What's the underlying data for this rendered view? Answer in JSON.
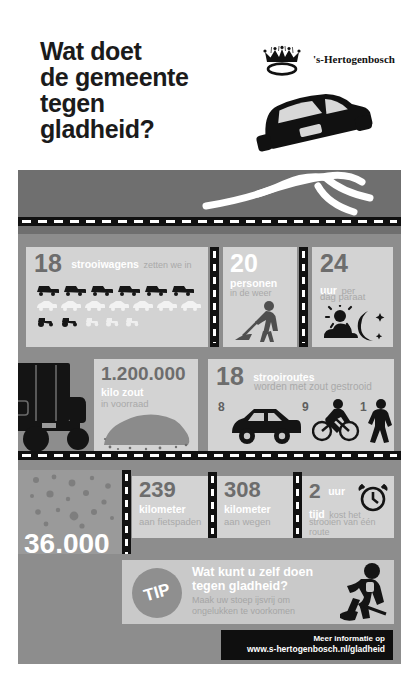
{
  "poster": {
    "title_lines": [
      "Wat doet",
      "de gemeente",
      "tegen",
      "gladheid?"
    ],
    "city": "'s-Hertogenbosch"
  },
  "colors": {
    "page_bg": "#ffffff",
    "poster_bg": "#8d8d8d",
    "panel": "#c9c9c9",
    "road": "#6f6f6f",
    "dash": "#111111",
    "num_grey": "#6d6d6d",
    "label_white": "#ffffff",
    "sub_grey": "#a9a9a9",
    "footer_box": "#0f0f0f"
  },
  "stats": {
    "strooiwagens": {
      "number": "18",
      "label": "strooiwagens",
      "suffix": "zetten we in",
      "fleet_rows": [
        {
          "icon": "truck-icon",
          "count": 6,
          "tone": "dark"
        },
        {
          "icon": "car-icon",
          "count": 7,
          "tone": "light"
        },
        {
          "icon": "tractor-icon",
          "count": 2,
          "tone": "dark"
        },
        {
          "icon": "tractor-icon",
          "count": 3,
          "tone": "light"
        }
      ]
    },
    "personen": {
      "number": "20",
      "label": "personen",
      "sub": "in de weer",
      "icon": "worker-shovel-icon"
    },
    "uur_paraat": {
      "number": "24",
      "label": "uur",
      "label_tail": "per",
      "sub": "dag paraat",
      "icon": "sun-cloud-moon-icon"
    },
    "kilo_voorraad": {
      "number": "1.200.000",
      "label": "kilo zout",
      "sub": "in voorraad",
      "icon": "salt-pile-icon"
    },
    "strooiroutes": {
      "number": "18",
      "label": "strooiroutes",
      "sub": "worden met zout gestrooid",
      "breakdown": [
        {
          "count": "8",
          "icon": "car-icon"
        },
        {
          "count": "9",
          "icon": "bicycle-icon"
        },
        {
          "count": "1",
          "icon": "pedestrian-icon"
        }
      ]
    },
    "fietspaden": {
      "number": "239",
      "label": "kilometer",
      "sub": "aan fietspaden"
    },
    "wegen": {
      "number": "308",
      "label": "kilometer",
      "sub": "aan wegen"
    },
    "tijd_route": {
      "number": "2",
      "label": "uur",
      "label2": "tijd",
      "label2_tail": "kost het",
      "sub": "strooien van één route",
      "icon": "alarm-clock-icon"
    },
    "kilo_gestrooid": {
      "number": "36.000",
      "label": "kilo zout",
      "sub_line1": "wordt er gemiddeld",
      "sub_line2": "gestrooid"
    }
  },
  "tip": {
    "badge": "TIP",
    "heading_line1": "Wat kunt u zelf doen",
    "heading_line2": "tegen gladheid?",
    "sub_line1": "Maak uw stoep ijsvrij om",
    "sub_line2": "ongelukken te voorkomen",
    "icon": "person-shoveling-icon"
  },
  "footer": {
    "line1": "Meer informatie op",
    "line2": "www.s-hertogenbosch.nl/gladheid"
  }
}
